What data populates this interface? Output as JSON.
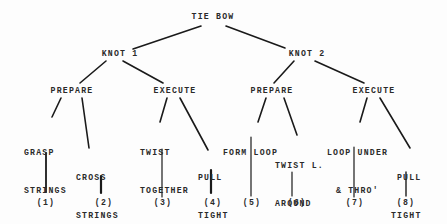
{
  "diagram": {
    "root": {
      "label": "TIE BOW"
    },
    "level1": [
      {
        "label": "KNOT 1"
      },
      {
        "label": "KNOT 2"
      }
    ],
    "level2": [
      {
        "label": "PREPARE",
        "parent": "KNOT 1"
      },
      {
        "label": "EXECUTE",
        "parent": "KNOT 1"
      },
      {
        "label": "PREPARE",
        "parent": "KNOT 2"
      },
      {
        "label": "EXECUTE",
        "parent": "KNOT 2"
      }
    ],
    "leaves": [
      {
        "line1": "GRASP",
        "line2": "STRINGS",
        "line3": "",
        "number": "(1)"
      },
      {
        "line1": "CROSS",
        "line2": "STRINGS",
        "line3": "",
        "number": "(2)"
      },
      {
        "line1": "TWIST",
        "line2": "TOGETHER",
        "line3": "",
        "number": "(3)"
      },
      {
        "line1": "PULL",
        "line2": "TIGHT",
        "line3": "",
        "number": "(4)"
      },
      {
        "line1": "FORM LOOP",
        "line2": "",
        "line3": "",
        "number": "(5)"
      },
      {
        "line1": "TWIST L.",
        "line2": "AROUND",
        "line3": "LOOP",
        "number": "(6)"
      },
      {
        "line1": "LOOP UNDER",
        "line2": "& THRO'",
        "line3": "",
        "number": "(7)"
      },
      {
        "line1": "PULL",
        "line2": "TIGHT",
        "line3": "",
        "number": "(8)"
      }
    ]
  },
  "colors": {
    "line": "#1a1a1a",
    "text": "#2a2a2a",
    "background": "#fdfdfd"
  }
}
